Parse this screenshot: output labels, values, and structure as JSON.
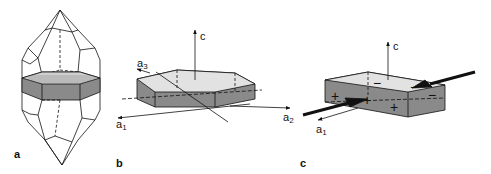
{
  "figure": {
    "panels": [
      {
        "id": "a",
        "label": "a",
        "description": "Quartz crystal with a horizontal plate slice (shaded)"
      },
      {
        "id": "b",
        "label": "b",
        "description": "Hexagonal plate with crystallographic axes",
        "axes": {
          "c": "c",
          "a1": "a",
          "a1_sub": "1",
          "a2": "a",
          "a2_sub": "2",
          "a3": "a",
          "a3_sub": "3"
        }
      },
      {
        "id": "c",
        "label": "c",
        "description": "Rectangular plate under compression along a1 with induced charges",
        "axes": {
          "c": "c",
          "a1": "a",
          "a1_sub": "1"
        },
        "charges": [
          "+",
          "+",
          "+",
          "−",
          "−",
          "−"
        ]
      }
    ],
    "colors": {
      "line": "#111111",
      "shade_dark": "#8a8a8a",
      "shade_light": "#dcdcdc",
      "background": "#ffffff"
    }
  }
}
